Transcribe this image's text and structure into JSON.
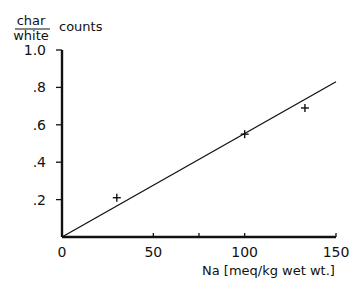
{
  "chart_data": {
    "type": "scatter",
    "title": "",
    "ylabel_numerator": "char",
    "ylabel_denominator": "white",
    "ylabel_suffix": "counts",
    "ylabel": "char/white counts",
    "xlabel": "Na [meq/kg wet wt.]",
    "xlim": [
      0,
      150
    ],
    "ylim": [
      0,
      1.0
    ],
    "x_ticks": [
      0,
      50,
      100,
      150
    ],
    "x_tick_labels": [
      "0",
      "50",
      "100",
      "150"
    ],
    "x_minor_ticks": [
      75
    ],
    "y_ticks": [
      0.2,
      0.4,
      0.6,
      0.8,
      1.0
    ],
    "y_tick_labels": [
      ".2",
      ".4",
      ".6",
      ".8",
      "1.0"
    ],
    "grid": false,
    "legend": null,
    "series": [
      {
        "name": "measured",
        "marker": "+",
        "x": [
          30,
          100,
          133
        ],
        "y": [
          0.21,
          0.55,
          0.69
        ]
      },
      {
        "name": "fit line",
        "type": "line",
        "x": [
          0,
          150
        ],
        "y": [
          0,
          0.83
        ]
      }
    ]
  }
}
